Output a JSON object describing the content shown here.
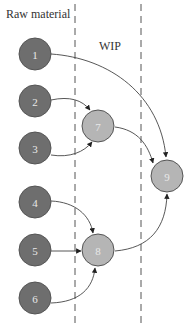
{
  "diagram": {
    "zones": [
      {
        "label": "Raw material",
        "x": 6,
        "y": 18
      },
      {
        "label": "WIP",
        "x": 99,
        "y": 50
      }
    ],
    "dividers": [
      75,
      141
    ],
    "colors": {
      "raw_node": "#6e6e6e",
      "wip_node": "#b5b5b5",
      "node_stroke": "#555555",
      "edge": "#444444",
      "divider": "#555555"
    },
    "nodes": [
      {
        "id": "1",
        "label": "1",
        "type": "raw",
        "cx": 35,
        "cy": 54
      },
      {
        "id": "2",
        "label": "2",
        "type": "raw",
        "cx": 35,
        "cy": 101
      },
      {
        "id": "3",
        "label": "3",
        "type": "raw",
        "cx": 35,
        "cy": 148
      },
      {
        "id": "4",
        "label": "4",
        "type": "raw",
        "cx": 35,
        "cy": 202
      },
      {
        "id": "5",
        "label": "5",
        "type": "raw",
        "cx": 35,
        "cy": 250
      },
      {
        "id": "6",
        "label": "6",
        "type": "raw",
        "cx": 35,
        "cy": 298
      },
      {
        "id": "7",
        "label": "7",
        "type": "wip",
        "cx": 98,
        "cy": 126
      },
      {
        "id": "8",
        "label": "8",
        "type": "wip",
        "cx": 98,
        "cy": 250
      },
      {
        "id": "9",
        "label": "9",
        "type": "wip",
        "cx": 167,
        "cy": 176
      }
    ],
    "edges": [
      {
        "from": "1",
        "to": "9"
      },
      {
        "from": "2",
        "to": "7"
      },
      {
        "from": "3",
        "to": "7"
      },
      {
        "from": "7",
        "to": "9"
      },
      {
        "from": "4",
        "to": "8"
      },
      {
        "from": "5",
        "to": "8"
      },
      {
        "from": "6",
        "to": "8"
      },
      {
        "from": "8",
        "to": "9"
      }
    ]
  }
}
